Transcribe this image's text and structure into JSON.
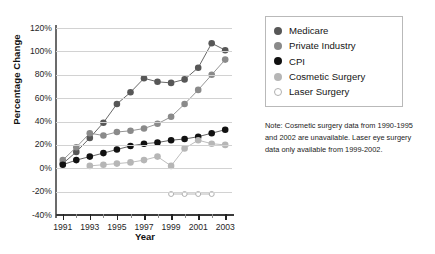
{
  "chart_data": {
    "type": "line",
    "title": "",
    "xlabel": "Year",
    "ylabel": "Percentage Change",
    "xlim": [
      1990.5,
      2003.5
    ],
    "ylim": [
      -40,
      120
    ],
    "ytick_step": 20,
    "grid": true,
    "legend_position": "top-right",
    "x_major_labels": [
      "1991",
      "1993",
      "1995",
      "1997",
      "1999",
      "2001",
      "2003"
    ],
    "x_major_values": [
      1991,
      1993,
      1995,
      1997,
      1999,
      2001,
      2003
    ],
    "x_minor_values": [
      1992,
      1994,
      1996,
      1998,
      2000,
      2002
    ],
    "ytick_labels": [
      "120%",
      "100%",
      "80%",
      "60%",
      "40%",
      "20%",
      "0%",
      "-20%",
      "-40%"
    ],
    "ytick_values": [
      120,
      100,
      80,
      60,
      40,
      20,
      0,
      -20,
      -40
    ],
    "series": [
      {
        "name": "Medicare",
        "color": "#575757",
        "marker": "filled-circle",
        "x": [
          1991,
          1992,
          1993,
          1994,
          1995,
          1996,
          1997,
          1998,
          1999,
          2000,
          2001,
          2002,
          2003
        ],
        "values": [
          4,
          14,
          26,
          39,
          55,
          65,
          77,
          74,
          73,
          76,
          86,
          107,
          101
        ]
      },
      {
        "name": "Private Industry",
        "color": "#8a8a8a",
        "marker": "filled-circle",
        "x": [
          1991,
          1992,
          1993,
          1994,
          1995,
          1996,
          1997,
          1998,
          1999,
          2000,
          2001,
          2002,
          2003
        ],
        "values": [
          7,
          18,
          30,
          28,
          31,
          32,
          34,
          38,
          44,
          55,
          67,
          80,
          93
        ]
      },
      {
        "name": "CPI",
        "color": "#111111",
        "marker": "filled-circle",
        "x": [
          1991,
          1992,
          1993,
          1994,
          1995,
          1996,
          1997,
          1998,
          1999,
          2000,
          2001,
          2002,
          2003
        ],
        "values": [
          3,
          7,
          10,
          13,
          16,
          19,
          21,
          22,
          24,
          25,
          27,
          30,
          33
        ]
      },
      {
        "name": "Cosmetic Surgery",
        "color": "#b6b6b6",
        "marker": "filled-circle",
        "x": [
          1993,
          1994,
          1995,
          1996,
          1997,
          1998,
          1999,
          2000,
          2001,
          2002,
          2003
        ],
        "values": [
          2,
          3,
          4,
          5,
          7,
          10,
          2,
          17,
          24,
          21,
          20
        ]
      },
      {
        "name": "Laser Surgery",
        "color": "#ffffff",
        "marker": "open-circle",
        "x": [
          1999,
          2000,
          2001,
          2002
        ],
        "values": [
          -22,
          -22,
          -22,
          -22
        ]
      }
    ]
  },
  "legend": {
    "items": [
      {
        "label": "Medicare",
        "color": "#575757",
        "marker": "filled-circle"
      },
      {
        "label": "Private Industry",
        "color": "#8a8a8a",
        "marker": "filled-circle"
      },
      {
        "label": "CPI",
        "color": "#111111",
        "marker": "filled-circle"
      },
      {
        "label": "Cosmetic Surgery",
        "color": "#b6b6b6",
        "marker": "filled-circle"
      },
      {
        "label": "Laser Surgery",
        "color": "#ffffff",
        "marker": "open-circle"
      }
    ]
  },
  "note": {
    "text": "Note: Cosmetic surgery data from 1990-1995 and 2002 are unavailable. Laser eye surgery data only available from 1999-2002."
  },
  "caption": {
    "text": ""
  }
}
